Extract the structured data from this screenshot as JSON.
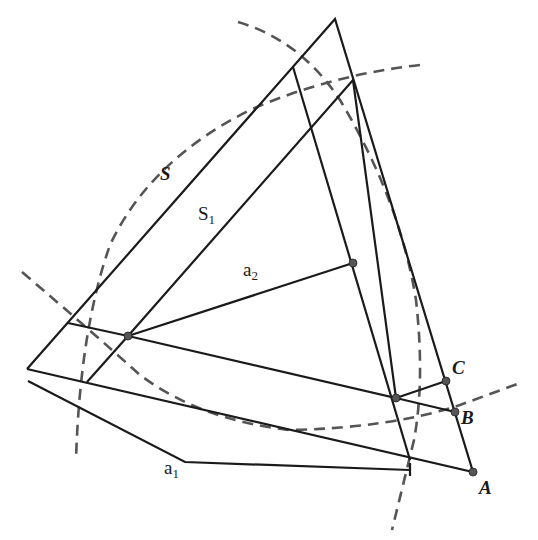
{
  "diagram": {
    "labels": {
      "S": "S",
      "S1_main": "S",
      "S1_sub": "1",
      "a2_main": "a",
      "a2_sub": "2",
      "a1_main": "a",
      "a1_sub": "1",
      "A": "A",
      "B": "B",
      "C": "C"
    },
    "colors": {
      "line": "#1a1a1a",
      "dashed": "#555555",
      "point": "#555555"
    }
  }
}
